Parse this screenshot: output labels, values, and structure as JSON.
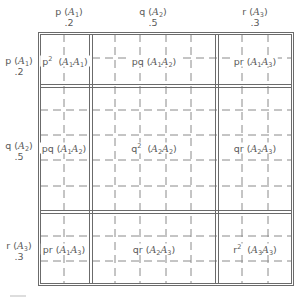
{
  "diagram": {
    "type": "punnett-square-allele-frequencies",
    "columns": [
      {
        "freq_symbol": "p",
        "allele": "A",
        "allele_sub": "1",
        "value": ".2"
      },
      {
        "freq_symbol": "q",
        "allele": "A",
        "allele_sub": "2",
        "value": ".5"
      },
      {
        "freq_symbol": "r",
        "allele": "A",
        "allele_sub": "3",
        "value": ".3"
      }
    ],
    "rows": [
      {
        "freq_symbol": "p",
        "allele": "A",
        "allele_sub": "1",
        "value": ".2"
      },
      {
        "freq_symbol": "q",
        "allele": "A",
        "allele_sub": "2",
        "value": ".5"
      },
      {
        "freq_symbol": "r",
        "allele": "A",
        "allele_sub": "3",
        "value": ".3"
      }
    ],
    "cells": [
      [
        {
          "freq": "p",
          "sup": "2",
          "g1": "1",
          "g2": "1"
        },
        {
          "freq": "pq",
          "sup": "",
          "g1": "1",
          "g2": "2"
        },
        {
          "freq": "pr",
          "sup": "",
          "g1": "1",
          "g2": "3"
        }
      ],
      [
        {
          "freq": "pq",
          "sup": "",
          "g1": "1",
          "g2": "2"
        },
        {
          "freq": "q",
          "sup": "2",
          "g1": "2",
          "g2": "2"
        },
        {
          "freq": "qr",
          "sup": "",
          "g1": "2",
          "g2": "3"
        }
      ],
      [
        {
          "freq": "pr",
          "sup": "",
          "g1": "1",
          "g2": "3"
        },
        {
          "freq": "qr",
          "sup": "",
          "g1": "2",
          "g2": "3"
        },
        {
          "freq": "r",
          "sup": "2",
          "g1": "3",
          "g2": "3"
        }
      ]
    ],
    "grid_subdivision": "0.1",
    "colors": {
      "line": "#6b6b6b",
      "text": "#5a5a5a",
      "background": "#ffffff"
    }
  }
}
